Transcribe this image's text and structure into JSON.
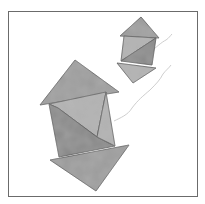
{
  "image": {
    "description": "Two tangram-style arrow figures made of grey watercolor triangles and quadrilaterals inside a thin square frame",
    "colors": {
      "background": "#ffffff",
      "frame": "#6b6b6b",
      "piece_fill": "#9a9a9a",
      "piece_fill_light": "#b0b0b0",
      "piece_fill_dark": "#858585",
      "edge": "#4a4a4a",
      "string": "#c8c8c8"
    },
    "figures": [
      {
        "name": "large-arrow",
        "pieces": [
          {
            "name": "top-triangle",
            "points": "75,60 40,105 119,92"
          },
          {
            "name": "body-upper",
            "points": "49,104 106,92 97,137 58,108"
          },
          {
            "name": "body-lower",
            "points": "49,104 58,108 97,137 115,146 59,157"
          },
          {
            "name": "body-right",
            "points": "106,92 115,146 97,137"
          },
          {
            "name": "bottom-triangle",
            "points": "50,160 129,145 96,191"
          }
        ]
      },
      {
        "name": "small-arrow",
        "pieces": [
          {
            "name": "top-triangle",
            "points": "141,17 120,36 159,38"
          },
          {
            "name": "body-upper",
            "points": "124,36 156,38 121,61"
          },
          {
            "name": "body-lower",
            "points": "156,38 152,65 121,61"
          },
          {
            "name": "bottom-triangle",
            "points": "117,63 156,68 133,83"
          }
        ]
      }
    ],
    "strings": [
      {
        "name": "long-string",
        "d": "M114,121 C120,118 128,115 132,108 C138,100 143,96 150,90 C156,84 160,80 163,74 C166,70 169,68 171,65"
      },
      {
        "name": "short-string",
        "d": "M151,52 C156,47 162,42 166,40 C169,38 170,36 172,34"
      }
    ]
  }
}
